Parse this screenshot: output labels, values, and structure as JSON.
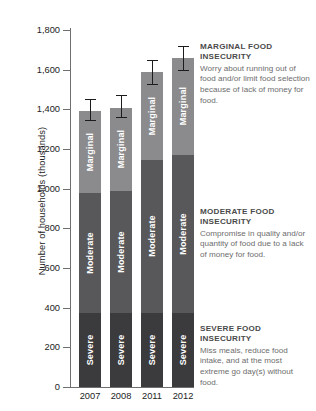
{
  "chart_data": {
    "type": "bar",
    "subtype": "stacked-bar-with-error-bars",
    "title": "",
    "xlabel": "",
    "ylabel": "Number of households (thousands)",
    "categories": [
      "2007",
      "2008",
      "2011",
      "2012"
    ],
    "ylim": [
      0,
      1800
    ],
    "yticks": [
      0,
      200,
      400,
      600,
      800,
      1000,
      1200,
      1400,
      1600,
      1800
    ],
    "ytick_labels": [
      "0",
      "200",
      "400",
      "600",
      "800",
      "1,000",
      "1,200",
      "1,400",
      "1,600",
      "1,800"
    ],
    "grid": false,
    "legend": "none",
    "stack_order_bottom_to_top": [
      "Severe",
      "Moderate",
      "Marginal"
    ],
    "series": [
      {
        "name": "Severe",
        "label": "Severe",
        "color": "#3b3b3d",
        "values": [
          373,
          373,
          373,
          373
        ]
      },
      {
        "name": "Moderate",
        "label": "Moderate",
        "color": "#58585a",
        "values": [
          607,
          617,
          772,
          797
        ]
      },
      {
        "name": "Marginal",
        "label": "Marginal",
        "color": "#8b8b8d",
        "values": [
          410,
          415,
          445,
          490
        ]
      }
    ],
    "totals": [
      1390,
      1405,
      1590,
      1660
    ],
    "error_bars": {
      "applies_to": "total",
      "values": [
        {
          "category": "2007",
          "total": 1390,
          "low": 1345,
          "high": 1450
        },
        {
          "category": "2008",
          "total": 1405,
          "low": 1360,
          "high": 1470
        },
        {
          "category": "2011",
          "total": 1590,
          "low": 1530,
          "high": 1650
        },
        {
          "category": "2012",
          "total": 1660,
          "low": 1600,
          "high": 1720
        }
      ]
    }
  },
  "annotations": [
    {
      "key": "marginal",
      "title": "Marginal food insecurity",
      "body": "Worry about running out of food and/or limit food selection because of lack of money for food."
    },
    {
      "key": "moderate",
      "title": "Moderate food insecurity",
      "body": "Compromise in quality and/or quantity of food due to a lack of money for food."
    },
    {
      "key": "severe",
      "title": "Severe food insecurity",
      "body": "Miss meals, reduce food intake, and at the most extreme go day(s) without food."
    }
  ],
  "colors": {
    "marginal": "#8b8b8d",
    "moderate": "#58585a",
    "severe": "#3b3b3d",
    "axis": "#6f6f6f",
    "error_bar": "#1c1c1c",
    "annotation_title": "#4a4a4a",
    "annotation_body": "#6d6d6d",
    "background": "#ffffff"
  }
}
